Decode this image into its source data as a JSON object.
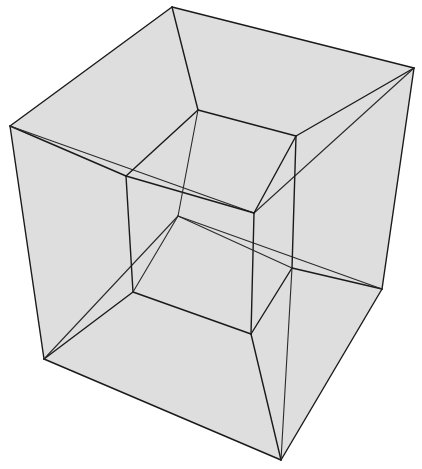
{
  "figure": {
    "title": "Tesseract (hypercube) perspective projection",
    "colors": {
      "background": "#ffffff",
      "face": "#8a8a8a",
      "edge": "#1a1a1a"
    },
    "outer_cube": {
      "vertices": {
        "back_top": [
          172,
          7
        ],
        "right_top": [
          414,
          68
        ],
        "left_top": [
          10,
          126
        ],
        "front_top": [
          258,
          213
        ],
        "back_bottom": [
          178,
          216
        ],
        "left_bottom": [
          44,
          359
        ],
        "right_bottom": [
          382,
          289
        ],
        "front_bottom": [
          281,
          460
        ]
      }
    },
    "inner_cube": {
      "vertices": {
        "back_top": [
          198,
          110
        ],
        "right_top": [
          296,
          136
        ],
        "left_top": [
          126,
          176
        ],
        "front_top": [
          254,
          213
        ],
        "back_bottom": [
          178,
          216
        ],
        "right_bottom": [
          292,
          268
        ],
        "left_bottom": [
          133,
          292
        ],
        "front_bottom": [
          251,
          334
        ]
      }
    }
  }
}
